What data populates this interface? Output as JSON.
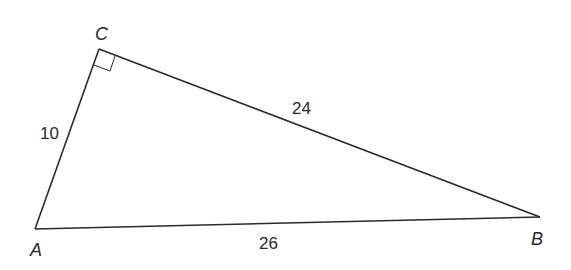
{
  "diagram": {
    "type": "right-triangle",
    "vertices": [
      {
        "label": "A",
        "x": 35,
        "y": 229
      },
      {
        "label": "B",
        "x": 540,
        "y": 217
      },
      {
        "label": "C",
        "x": 99,
        "y": 49
      }
    ],
    "right_angle_at": "C",
    "sides": [
      {
        "from": "A",
        "to": "C",
        "length_label": "10"
      },
      {
        "from": "C",
        "to": "B",
        "length_label": "24"
      },
      {
        "from": "A",
        "to": "B",
        "length_label": "26"
      }
    ],
    "stroke_color": "#2a2a2a"
  }
}
